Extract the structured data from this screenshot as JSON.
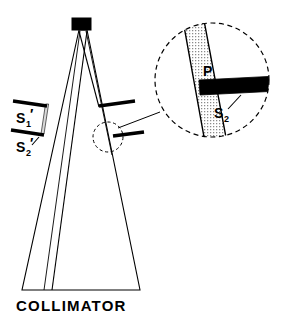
{
  "figure": {
    "title_label": "COLLIMATOR",
    "colors": {
      "stroke": "#000000",
      "background": "#ffffff",
      "fill_solid": "#000000",
      "fill_shaded": "#e0e0e0",
      "dashed": "#000000"
    },
    "labels": {
      "slit_1_prime": {
        "symbol": "S",
        "subscript": "1",
        "prime": "′"
      },
      "slit_2_prime": {
        "symbol": "S",
        "subscript": "2",
        "prime": "′"
      },
      "inset_plate": {
        "symbol": "P"
      },
      "inset_slit_2": {
        "symbol": "S",
        "subscript": "2",
        "prime": ""
      }
    },
    "parts": {
      "source_block": "source-block",
      "collimator_body": "collimator-body",
      "beam_ray_left": "beam-ray-left",
      "beam_ray_right": "beam-ray-right",
      "slit_bar_upper_left": "slit-bar-upper-left",
      "slit_bar_lower_left": "slit-bar-lower-left",
      "slit_bar_upper_right": "slit-bar-upper-right",
      "slit_bar_lower_right": "slit-bar-lower-right",
      "detail_circle": "detail-circle",
      "detail_leader": "detail-leader",
      "inset_circle": "inset-circle",
      "inset_shaded_band": "inset-shaded-band",
      "inset_black_bar": "inset-black-bar",
      "inset_leader": "inset-leader"
    }
  }
}
